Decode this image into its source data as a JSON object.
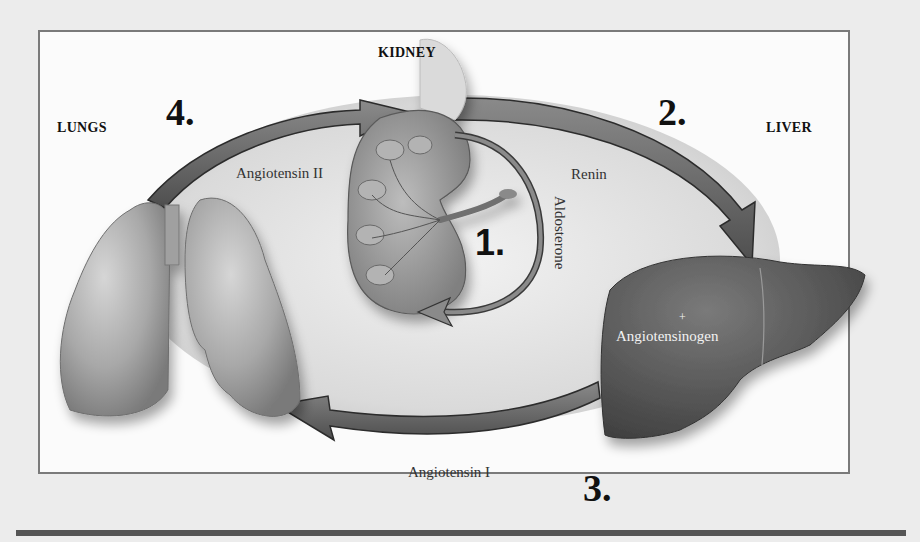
{
  "diagram": {
    "organs": {
      "kidney": "KIDNEY",
      "lungs": "LUNGS",
      "liver": "LIVER"
    },
    "steps": [
      {
        "number": "1.",
        "hormone": "Aldosterone",
        "from": "Kidney",
        "to": "Kidney"
      },
      {
        "number": "2.",
        "hormone": "Renin",
        "from": "Kidney",
        "to": "Liver"
      },
      {
        "number": "3.",
        "hormone": "Angiotensin I",
        "from": "Liver",
        "to": "Lungs"
      },
      {
        "number": "4.",
        "hormone": "Angiotensin II",
        "from": "Lungs",
        "to": "Kidney"
      }
    ],
    "liver_label": "Angiotensinogen",
    "liver_plus": "+"
  },
  "colors": {
    "frame_border": "#7a7a7a",
    "arrow": "#6a6a6a",
    "liver": "#5e5e5e",
    "lungs": "#a9a9a9",
    "kidney": "#9a9a9a"
  }
}
